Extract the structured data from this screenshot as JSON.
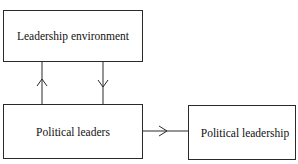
{
  "diagram": {
    "nodes": [
      {
        "id": "leadership-environment",
        "label": "Leadership environment"
      },
      {
        "id": "political-leaders",
        "label": "Political leaders"
      },
      {
        "id": "political-leadership",
        "label": "Political leadership"
      }
    ],
    "edges": [
      {
        "from": "political-leaders",
        "to": "leadership-environment"
      },
      {
        "from": "leadership-environment",
        "to": "political-leaders"
      },
      {
        "from": "political-leaders",
        "to": "political-leadership"
      }
    ]
  }
}
